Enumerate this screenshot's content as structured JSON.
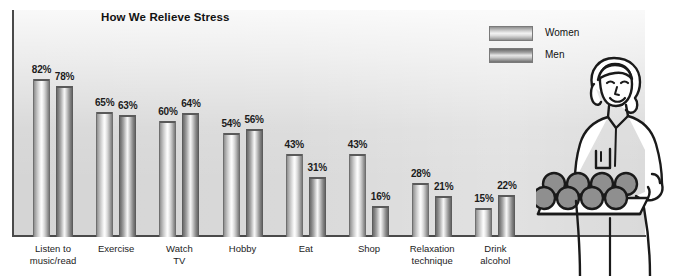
{
  "chart_data": {
    "type": "bar",
    "title": "How We Relieve Stress",
    "xlabel": "",
    "ylabel": "",
    "ylim": [
      0,
      100
    ],
    "grid": false,
    "legend_position": "top-right",
    "value_suffix": "%",
    "categories": [
      "Listen to\nmusic/read",
      "Exercise",
      "Watch\nTV",
      "Hobby",
      "Eat",
      "Shop",
      "Relaxation\ntechnique",
      "Drink\nalcohol"
    ],
    "series": [
      {
        "name": "Women",
        "values": [
          82,
          65,
          60,
          54,
          43,
          43,
          28,
          15
        ],
        "labels": [
          "82%",
          "65%",
          "60%",
          "54%",
          "43%",
          "43%",
          "28%",
          "15%"
        ],
        "color": "#c9c9c9"
      },
      {
        "name": "Men",
        "values": [
          78,
          63,
          64,
          56,
          31,
          16,
          21,
          22
        ],
        "labels": [
          "78%",
          "63%",
          "64%",
          "56%",
          "31%",
          "16%",
          "21%",
          "22%"
        ],
        "color": "#9a9a9a"
      }
    ]
  },
  "legend": {
    "items": [
      {
        "label": "Women",
        "swatch": "women"
      },
      {
        "label": "Men",
        "swatch": "men"
      }
    ]
  },
  "illustration": {
    "name": "woman-holding-tray-of-apples",
    "alt": "Line illustration of a smiling woman carrying a tray of apples"
  },
  "colors": {
    "background": "#ffffff",
    "plot_background": "#d5d5d5",
    "axis": "#4a4a4a",
    "text": "#1c1c1c",
    "bar_women": "#c9c9c9",
    "bar_men": "#9a9a9a"
  }
}
